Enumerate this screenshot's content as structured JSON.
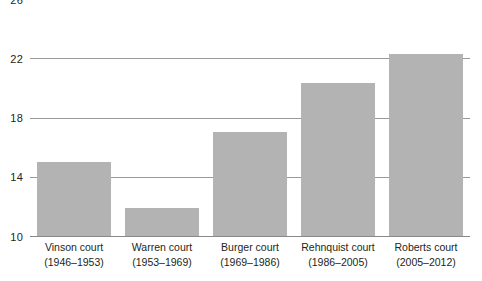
{
  "chart_data": {
    "type": "bar",
    "title": "",
    "subtitle": "",
    "xlabel": "",
    "ylabel": "",
    "ylim": [
      10,
      26
    ],
    "yticks": [
      10,
      14,
      18,
      22,
      26
    ],
    "ytick_labels": [
      "10",
      "14",
      "18",
      "22",
      "26"
    ],
    "grid": true,
    "legend": false,
    "legend_position": "none",
    "bar_color": "#b3b3b3",
    "gridline_color": "#9a9a9a",
    "axis_color": "#8a8a8a",
    "text_color": "#231f20",
    "categories": [
      "Vinson court (1946–1953)",
      "Warren court (1953–1969)",
      "Burger court (1969–1986)",
      "Rehnquist court (1986–2005)",
      "Roberts court (2005–2012)"
    ],
    "category_lines": [
      {
        "name": "Vinson court",
        "years": "(1946–1953)"
      },
      {
        "name": "Warren court",
        "years": "(1953–1969)"
      },
      {
        "name": "Burger court",
        "years": "(1969–1986)"
      },
      {
        "name": "Rehnquist court",
        "years": "(1986–2005)"
      },
      {
        "name": "Roberts court",
        "years": "(2005–2012)"
      }
    ],
    "values": [
      15.0,
      11.9,
      17.0,
      20.3,
      22.3
    ]
  }
}
